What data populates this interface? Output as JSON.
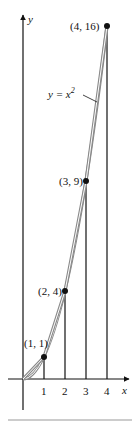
{
  "figure": {
    "curve_label": "y = x",
    "curve_label_sup": "2",
    "axis_x_label": "x",
    "axis_y_label": "y",
    "x_ticks": [
      "1",
      "2",
      "3",
      "4"
    ],
    "points": [
      {
        "label": "(1, 1)",
        "x": 1,
        "y": 1
      },
      {
        "label": "(2, 4)",
        "x": 2,
        "y": 4
      },
      {
        "label": "(3, 9)",
        "x": 3,
        "y": 9
      },
      {
        "label": "(4, 16)",
        "x": 4,
        "y": 16
      }
    ],
    "colors": {
      "curve": "#8a8a8a",
      "ink": "#111111",
      "rule": "#cccccc"
    }
  }
}
